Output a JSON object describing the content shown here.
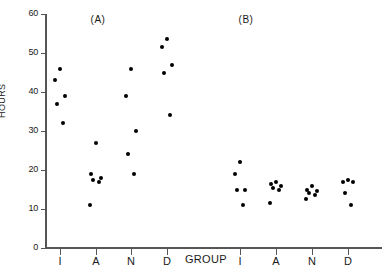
{
  "chart_data": {
    "type": "scatter",
    "title": "",
    "xlabel": "GROUP",
    "ylabel": "HOURS",
    "ylim": [
      0,
      60
    ],
    "yticks": [
      0,
      10,
      20,
      30,
      40,
      50,
      60
    ],
    "ytick_labels": [
      "0",
      "10",
      "20",
      "30",
      "40",
      "50",
      "60"
    ],
    "grid": false,
    "legend": "none",
    "categories": [
      "I",
      "A",
      "N",
      "D"
    ],
    "panels": [
      {
        "label": "(A)",
        "groups": [
          {
            "name": "I",
            "values": [
              46,
              43,
              39,
              37,
              32
            ]
          },
          {
            "name": "A",
            "values": [
              27,
              19,
              18,
              17.5,
              17,
              11
            ]
          },
          {
            "name": "N",
            "values": [
              46,
              39,
              30,
              24,
              19
            ]
          },
          {
            "name": "D",
            "values": [
              53.5,
              51.5,
              47,
              45,
              34
            ]
          }
        ]
      },
      {
        "label": "(B)",
        "groups": [
          {
            "name": "I",
            "values": [
              22,
              19,
              15,
              15,
              11
            ]
          },
          {
            "name": "A",
            "values": [
              17,
              16.5,
              16,
              15.5,
              15,
              11.5
            ]
          },
          {
            "name": "N",
            "values": [
              16,
              15,
              14.5,
              14,
              13.5,
              12.5
            ]
          },
          {
            "name": "D",
            "values": [
              17.5,
              17,
              17,
              14,
              11
            ]
          }
        ]
      }
    ]
  },
  "axes": {
    "y_title": "HOURS",
    "x_title": "GROUP",
    "y_ticks": [
      {
        "label": "60",
        "value": 60
      },
      {
        "label": "50",
        "value": 50
      },
      {
        "label": "40",
        "value": 40
      },
      {
        "label": "30",
        "value": 30
      },
      {
        "label": "20",
        "value": 20
      },
      {
        "label": "10",
        "value": 10
      },
      {
        "label": "0",
        "value": 0
      }
    ],
    "x_ticks": [
      {
        "label": "I",
        "panel": "A"
      },
      {
        "label": "A",
        "panel": "A"
      },
      {
        "label": "N",
        "panel": "A"
      },
      {
        "label": "D",
        "panel": "A"
      },
      {
        "label": "I",
        "panel": "B"
      },
      {
        "label": "A",
        "panel": "B"
      },
      {
        "label": "N",
        "panel": "B"
      },
      {
        "label": "D",
        "panel": "B"
      }
    ]
  },
  "panel_labels": [
    {
      "text": "(A)",
      "x": 98
    },
    {
      "text": "(B)",
      "x": 246
    }
  ],
  "colors": {
    "marker": "#000000",
    "axis": "#555555",
    "text": "#1a1a1a",
    "background": "#ffffff"
  }
}
